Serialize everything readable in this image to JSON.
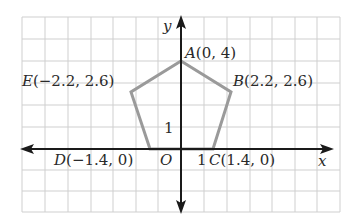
{
  "figure": {
    "type": "coordinate-plane-pentagon",
    "grid": {
      "x_range": [
        -7,
        7
      ],
      "y_range": [
        -3,
        6
      ],
      "step": 1
    },
    "axes": {
      "x_label": "x",
      "y_label": "y",
      "origin_label": "O",
      "x_tick_label": "1",
      "y_tick_label": "1"
    },
    "colors": {
      "grid": "#cfcfcf",
      "axis": "#1a1a1a",
      "polygon": "#9a9a9a",
      "text": "#2a2a2a"
    },
    "points": [
      {
        "name": "A",
        "label": "A",
        "coords": "(0, 4)",
        "x": 0,
        "y": 4
      },
      {
        "name": "B",
        "label": "B",
        "coords": "(2.2, 2.6)",
        "x": 2.2,
        "y": 2.6
      },
      {
        "name": "C",
        "label": "C",
        "coords": "(1.4, 0)",
        "x": 1.4,
        "y": 0
      },
      {
        "name": "D",
        "label": "D",
        "coords": "(−1.4, 0)",
        "x": -1.4,
        "y": 0
      },
      {
        "name": "E",
        "label": "E",
        "coords": "(−2.2, 2.6)",
        "x": -2.2,
        "y": 2.6
      }
    ]
  }
}
